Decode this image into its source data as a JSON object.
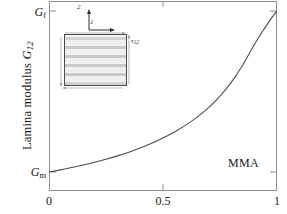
{
  "chart_data": {
    "type": "line",
    "title": "",
    "xlabel": "",
    "ylabel": "Lamina modulus G12",
    "ylabel_main": "Lamina modulus ",
    "ylabel_var": "G",
    "ylabel_sub": "12",
    "xlim": [
      0,
      1
    ],
    "ylim_labels": [
      "Gm",
      "Gf"
    ],
    "grid": false,
    "legend_position": "none",
    "xticks": [
      {
        "value": 0,
        "label": "0"
      },
      {
        "value": 0.5,
        "label": "0.5"
      },
      {
        "value": 1,
        "label": "1"
      }
    ],
    "yticks": [
      {
        "value": 1,
        "label_var": "G",
        "label_sub": "f",
        "label": "Gf"
      },
      {
        "value": 0,
        "label_var": "G",
        "label_sub": "m",
        "label": "Gm"
      }
    ],
    "series": [
      {
        "name": "MMA",
        "annotation": "MMA",
        "color": "#4d4d4d",
        "x": [
          0.0,
          0.05,
          0.1,
          0.15,
          0.2,
          0.25,
          0.3,
          0.35,
          0.4,
          0.45,
          0.5,
          0.55,
          0.6,
          0.65,
          0.7,
          0.75,
          0.8,
          0.85,
          0.9,
          0.94,
          0.97,
          0.99,
          1.0
        ],
        "y": [
          0.0,
          0.013,
          0.028,
          0.043,
          0.06,
          0.079,
          0.1,
          0.123,
          0.149,
          0.178,
          0.211,
          0.248,
          0.291,
          0.341,
          0.4,
          0.471,
          0.558,
          0.665,
          0.79,
          0.88,
          0.945,
          0.982,
          1.0
        ]
      }
    ]
  },
  "axis_titles": {
    "y_prefix": "Lamina modulus ",
    "y_var": "G",
    "y_sub": "12"
  },
  "annotations": {
    "curve_label": "MMA"
  },
  "inset": {
    "name": "rve-laminate-diagram",
    "axis_vertical_label": "2",
    "axis_horizontal_label": "1",
    "stress_label_var": "τ",
    "stress_label_sub": "12",
    "stress_label": "τ12",
    "bands": [
      {
        "top": 2,
        "height": 3,
        "color": "#d2d2d2"
      },
      {
        "top": 5,
        "height": 5,
        "color": "#efefef"
      },
      {
        "top": 11,
        "height": 3,
        "color": "#c9c9c9"
      },
      {
        "top": 14,
        "height": 5,
        "color": "#efefef"
      },
      {
        "top": 20,
        "height": 3,
        "color": "#c9c9c9"
      },
      {
        "top": 23,
        "height": 5,
        "color": "#efefef"
      },
      {
        "top": 29,
        "height": 3,
        "color": "#c9c9c9"
      },
      {
        "top": 32,
        "height": 5,
        "color": "#efefef"
      },
      {
        "top": 38,
        "height": 3,
        "color": "#c9c9c9"
      },
      {
        "top": 41,
        "height": 5,
        "color": "#efefef"
      },
      {
        "top": 47,
        "height": 3,
        "color": "#d2d2d2"
      }
    ]
  },
  "colors": {
    "curve": "#4d4d4d",
    "frame": "#8d8d8d",
    "text": "#1a1a1a",
    "background": "#ffffff",
    "inset_border": "#4a4a4a"
  }
}
